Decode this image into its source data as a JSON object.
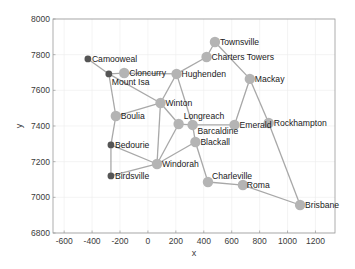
{
  "chart_data": {
    "type": "network-graph",
    "title": "",
    "xlabel": "x",
    "ylabel": "y",
    "xlim": [
      -680,
      1340
    ],
    "ylim": [
      6800,
      8000
    ],
    "xticks": [
      -600,
      -400,
      -200,
      0,
      200,
      400,
      600,
      800,
      1000,
      1200
    ],
    "yticks": [
      6800,
      7000,
      7200,
      7400,
      7600,
      7800,
      8000
    ],
    "grid": true,
    "colors": {
      "edge": "#a8a8a8",
      "node_light": "#b4b4b4",
      "node_dark": "#555555",
      "axis": "#9a9a9a",
      "grid": "#ececec"
    },
    "nodes": [
      {
        "name": "Camooweal",
        "x": -430,
        "y": 7776,
        "dark": true,
        "label_dx": 4,
        "label_dy": 3
      },
      {
        "name": "Mount Isa",
        "x": -280,
        "y": 7692,
        "dark": true,
        "label_dx": 3,
        "label_dy": 11
      },
      {
        "name": "Cloncurry",
        "x": -170,
        "y": 7697,
        "dark": false,
        "label_dx": 5,
        "label_dy": 3
      },
      {
        "name": "Hughenden",
        "x": 205,
        "y": 7692,
        "dark": false,
        "label_dx": 5,
        "label_dy": 3
      },
      {
        "name": "Charters Towers",
        "x": 420,
        "y": 7787,
        "dark": false,
        "label_dx": 5,
        "label_dy": 3
      },
      {
        "name": "Townsville",
        "x": 480,
        "y": 7871,
        "dark": false,
        "label_dx": 5,
        "label_dy": 3
      },
      {
        "name": "Mackay",
        "x": 730,
        "y": 7664,
        "dark": false,
        "label_dx": 5,
        "label_dy": 3
      },
      {
        "name": "Winton",
        "x": 90,
        "y": 7529,
        "dark": false,
        "label_dx": 5,
        "label_dy": 3
      },
      {
        "name": "Boulia",
        "x": -230,
        "y": 7456,
        "dark": false,
        "label_dx": 5,
        "label_dy": 3
      },
      {
        "name": "Longreach",
        "x": 220,
        "y": 7411,
        "dark": false,
        "label_dx": 5,
        "label_dy": -5
      },
      {
        "name": "Barcaldine",
        "x": 320,
        "y": 7406,
        "dark": false,
        "label_dx": 5,
        "label_dy": 9
      },
      {
        "name": "Emerald",
        "x": 620,
        "y": 7406,
        "dark": false,
        "label_dx": 5,
        "label_dy": 3
      },
      {
        "name": "Rockhampton",
        "x": 865,
        "y": 7417,
        "dark": false,
        "label_dx": 5,
        "label_dy": 3
      },
      {
        "name": "Blackall",
        "x": 340,
        "y": 7310,
        "dark": false,
        "label_dx": 5,
        "label_dy": 3
      },
      {
        "name": "Bedourie",
        "x": -265,
        "y": 7294,
        "dark": true,
        "label_dx": 4,
        "label_dy": 3
      },
      {
        "name": "Windorah",
        "x": 65,
        "y": 7187,
        "dark": false,
        "label_dx": 5,
        "label_dy": 3
      },
      {
        "name": "Birdsville",
        "x": -265,
        "y": 7120,
        "dark": true,
        "label_dx": 4,
        "label_dy": 3
      },
      {
        "name": "Charleville",
        "x": 430,
        "y": 7086,
        "dark": false,
        "label_dx": 4,
        "label_dy": -3
      },
      {
        "name": "Roma",
        "x": 680,
        "y": 7069,
        "dark": false,
        "label_dx": 4,
        "label_dy": 3
      },
      {
        "name": "Brisbane",
        "x": 1090,
        "y": 6957,
        "dark": false,
        "label_dx": 5,
        "label_dy": 3
      }
    ],
    "edges": [
      [
        "Camooweal",
        "Mount Isa"
      ],
      [
        "Mount Isa",
        "Cloncurry"
      ],
      [
        "Mount Isa",
        "Boulia"
      ],
      [
        "Mount Isa",
        "Winton"
      ],
      [
        "Cloncurry",
        "Hughenden"
      ],
      [
        "Hughenden",
        "Charters Towers"
      ],
      [
        "Charters Towers",
        "Townsville"
      ],
      [
        "Townsville",
        "Mackay"
      ],
      [
        "Hughenden",
        "Winton"
      ],
      [
        "Hughenden",
        "Barcaldine"
      ],
      [
        "Winton",
        "Boulia"
      ],
      [
        "Winton",
        "Longreach"
      ],
      [
        "Winton",
        "Windorah"
      ],
      [
        "Longreach",
        "Barcaldine"
      ],
      [
        "Longreach",
        "Windorah"
      ],
      [
        "Barcaldine",
        "Emerald"
      ],
      [
        "Barcaldine",
        "Blackall"
      ],
      [
        "Emerald",
        "Mackay"
      ],
      [
        "Mackay",
        "Rockhampton"
      ],
      [
        "Rockhampton",
        "Brisbane"
      ],
      [
        "Boulia",
        "Bedourie"
      ],
      [
        "Bedourie",
        "Birdsville"
      ],
      [
        "Bedourie",
        "Windorah"
      ],
      [
        "Birdsville",
        "Windorah"
      ],
      [
        "Windorah",
        "Blackall"
      ],
      [
        "Blackall",
        "Charleville"
      ],
      [
        "Charleville",
        "Roma"
      ],
      [
        "Roma",
        "Brisbane"
      ]
    ]
  },
  "layout": {
    "plot_left": 53,
    "plot_right": 335,
    "plot_top": 19,
    "plot_bottom": 233
  }
}
